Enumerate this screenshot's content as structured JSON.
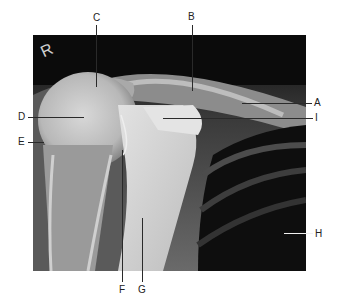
{
  "figure": {
    "type": "radiograph",
    "side_marker": "R",
    "labels": [
      {
        "id": "A",
        "text": "A"
      },
      {
        "id": "B",
        "text": "B"
      },
      {
        "id": "C",
        "text": "C"
      },
      {
        "id": "D",
        "text": "D"
      },
      {
        "id": "E",
        "text": "E"
      },
      {
        "id": "F",
        "text": "F"
      },
      {
        "id": "G",
        "text": "G"
      },
      {
        "id": "H",
        "text": "H"
      },
      {
        "id": "I",
        "text": "I"
      }
    ]
  }
}
